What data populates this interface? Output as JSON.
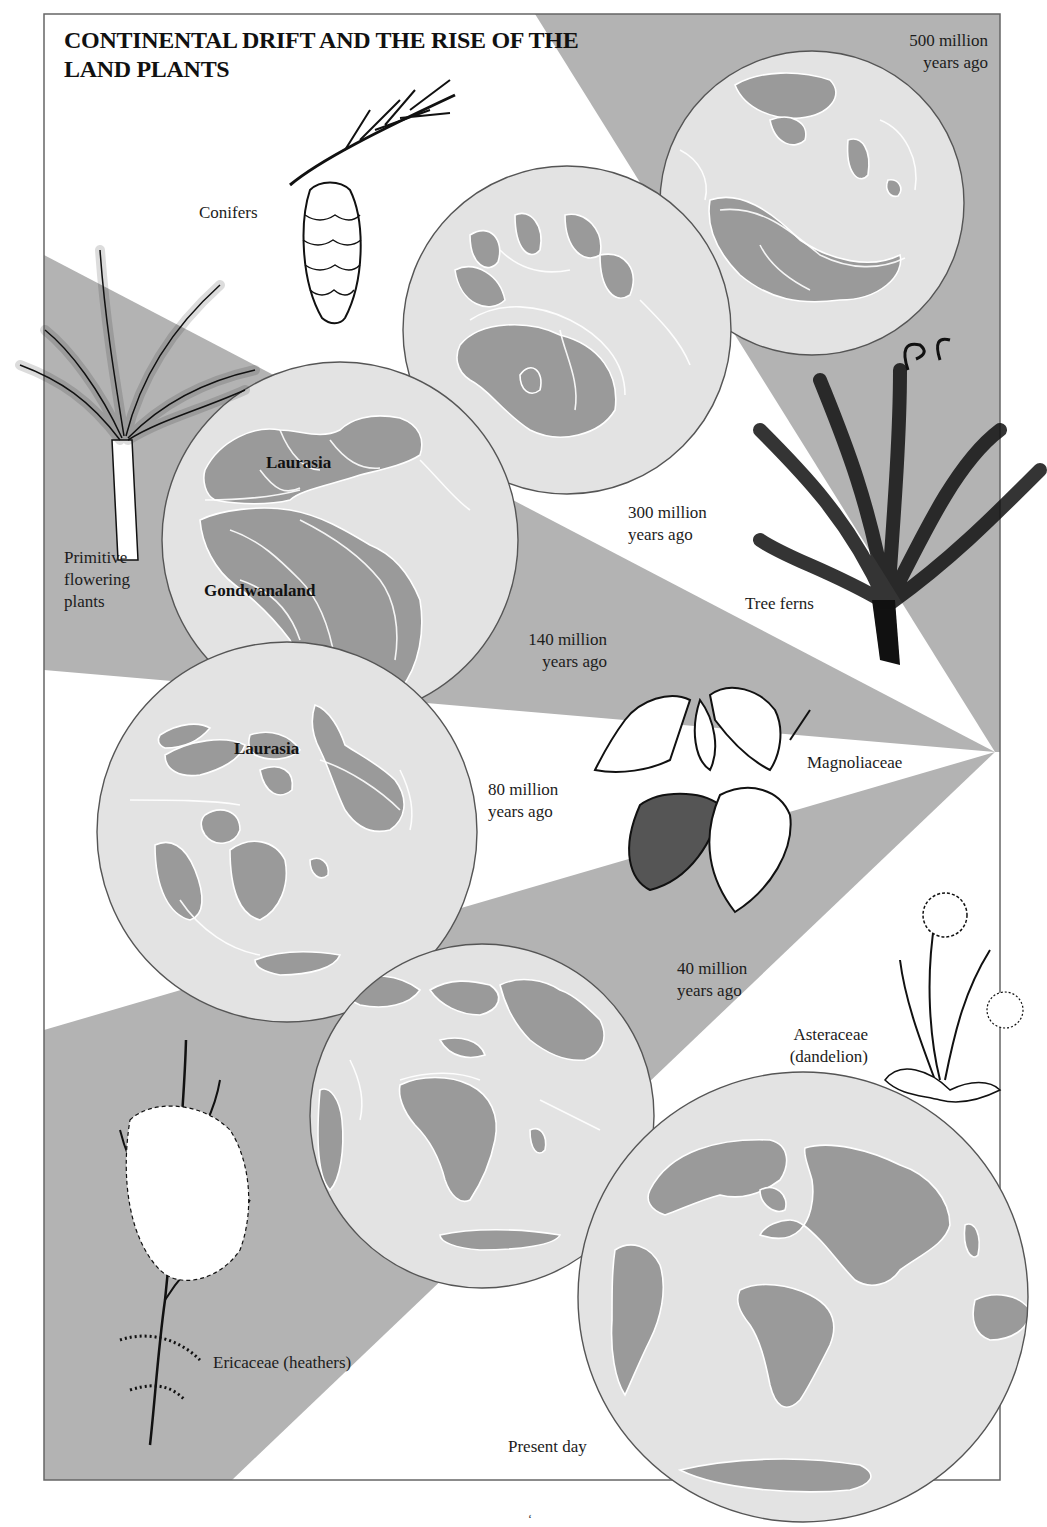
{
  "title": {
    "line1": "CONTINENTAL DRIFT AND THE RISE OF THE",
    "line2": "LAND PLANTS"
  },
  "colors": {
    "wedge_gray": "#b3b3b3",
    "globe_ocean": "#e3e3e3",
    "globe_land": "#9a9a9a",
    "outline": "#555555",
    "coast_line": "#ffffff",
    "background": "#ffffff"
  },
  "eras": [
    {
      "id": "500",
      "line1": "500 million",
      "line2": "years ago"
    },
    {
      "id": "300",
      "line1": "300 million",
      "line2": "years ago"
    },
    {
      "id": "140",
      "line1": "140 million",
      "line2": "years ago"
    },
    {
      "id": "80",
      "line1": "80 million",
      "line2": "years ago"
    },
    {
      "id": "40",
      "line1": "40 million",
      "line2": "years ago"
    },
    {
      "id": "0",
      "line1": "Present day",
      "line2": ""
    }
  ],
  "plants": [
    {
      "id": "conifers",
      "line1": "Conifers",
      "line2": "",
      "line3": "",
      "icon": "pine-cone-icon"
    },
    {
      "id": "primitive",
      "line1": "Primitive",
      "line2": "flowering",
      "line3": "plants",
      "icon": "cycad-plant-icon"
    },
    {
      "id": "treeferns",
      "line1": "Tree ferns",
      "line2": "",
      "line3": "",
      "icon": "tree-fern-icon"
    },
    {
      "id": "magnolia",
      "line1": "Magnoliaceae",
      "line2": "",
      "line3": "",
      "icon": "magnolia-flower-icon"
    },
    {
      "id": "asteraceae",
      "line1": "Asteraceae",
      "line2": "(dandelion)",
      "line3": "",
      "icon": "dandelion-icon"
    },
    {
      "id": "ericaceae",
      "line1": "Ericaceae (heathers)",
      "line2": "",
      "line3": "",
      "icon": "heather-icon"
    }
  ],
  "continents": {
    "laurasia_140": "Laurasia",
    "gondwana_140": "Gondwanaland",
    "laurasia_80": "Laurasia"
  },
  "page_mark": "‘"
}
